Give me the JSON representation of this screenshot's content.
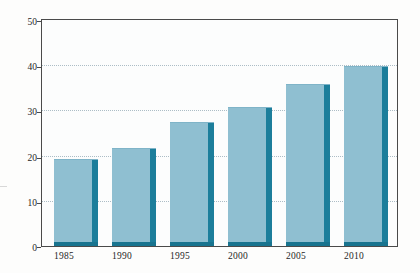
{
  "chart_data": {
    "type": "bar",
    "title": "",
    "subtitle": "",
    "xlabel": "",
    "ylabel": "",
    "categories": [
      "1985",
      "1990",
      "1995",
      "2000",
      "2005",
      "2010"
    ],
    "values": [
      19.3,
      21.6,
      27.5,
      30.8,
      35.9,
      39.8
    ],
    "series": [
      {
        "name": "",
        "values": [
          19.3,
          21.6,
          27.5,
          30.8,
          35.9,
          39.8
        ]
      }
    ],
    "ylim": [
      0,
      50
    ],
    "yticks": [
      0,
      10,
      20,
      30,
      40,
      50
    ],
    "ytick_labels": [
      "0",
      "10",
      "20",
      "30",
      "40",
      "50"
    ],
    "gridlines_at": [
      10,
      20,
      30,
      40
    ],
    "grid": true,
    "grid_style": "dotted",
    "legend": null,
    "legend_position": "none",
    "annotations": [],
    "colors": {
      "bar_face": "#8fbfd1",
      "bar_shadow": "#1c7e9b",
      "bar_base": "#18748f",
      "gridline": "#9fb3bd",
      "axis": "#4a4a4a",
      "plot_background": "#fcfdfd",
      "page_background": "#fdfdfc",
      "text": "#262626"
    }
  },
  "axes": {
    "y": {
      "ticks": [
        {
          "label": "50",
          "value": 50
        },
        {
          "label": "40",
          "value": 40
        },
        {
          "label": "30",
          "value": 30
        },
        {
          "label": "20",
          "value": 20
        },
        {
          "label": "10",
          "value": 10
        },
        {
          "label": "0",
          "value": 0
        }
      ]
    },
    "x": {
      "ticks": [
        {
          "label": "1985"
        },
        {
          "label": "1990"
        },
        {
          "label": "1995"
        },
        {
          "label": "2000"
        },
        {
          "label": "2005"
        },
        {
          "label": "2010"
        }
      ]
    }
  }
}
